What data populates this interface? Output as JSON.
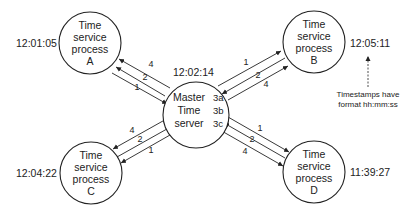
{
  "diagram": {
    "nodes": {
      "master": {
        "lines": [
          "Master",
          "Time",
          "server"
        ],
        "time": "12:02:14",
        "steps": [
          "3a",
          "3b",
          "3c"
        ]
      },
      "a": {
        "lines": [
          "Time",
          "service",
          "process",
          "A"
        ],
        "time": "12:01:05"
      },
      "b": {
        "lines": [
          "Time",
          "service",
          "process",
          "B"
        ],
        "time": "12:05:11"
      },
      "c": {
        "lines": [
          "Time",
          "service",
          "process",
          "C"
        ],
        "time": "12:04:22"
      },
      "d": {
        "lines": [
          "Time",
          "service",
          "process",
          "D"
        ],
        "time": "11:39:27"
      }
    },
    "edges": {
      "a": [
        "4",
        "2",
        "1"
      ],
      "b": [
        "1",
        "2",
        "4"
      ],
      "c": [
        "4",
        "2",
        "1"
      ],
      "d": [
        "1",
        "2",
        "4"
      ]
    },
    "note": {
      "lines": [
        "Timestamps have",
        "format hh:mm:ss"
      ]
    }
  }
}
